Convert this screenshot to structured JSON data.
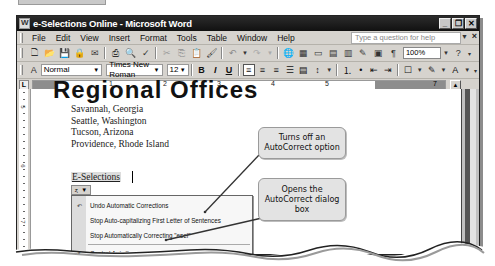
{
  "window": {
    "title": "e-Selections Online - Microsoft Word",
    "controls": [
      "minimize",
      "restore",
      "close"
    ]
  },
  "menubar": {
    "items": [
      "File",
      "Edit",
      "View",
      "Insert",
      "Format",
      "Tools",
      "Table",
      "Window",
      "Help"
    ],
    "help_placeholder": "Type a question for help",
    "close_doc": "×"
  },
  "standard_toolbar": {
    "zoom": "100%",
    "icons": [
      "new",
      "open",
      "save",
      "permission",
      "email",
      "print",
      "print-preview",
      "spelling",
      "cut",
      "copy",
      "paste",
      "format-painter",
      "undo",
      "redo",
      "hyperlink",
      "tables-borders",
      "insert-table",
      "insert-excel",
      "columns",
      "drawing",
      "document-map",
      "show-hide",
      "zoom",
      "help"
    ]
  },
  "format_toolbar": {
    "style": "Normal",
    "font": "Times New Roman",
    "size": "12",
    "bold": "B",
    "italic": "I",
    "underline": "U",
    "show_hide": "¶"
  },
  "ruler": {
    "numbers": [
      "1",
      "2",
      "3",
      "4",
      "5",
      "7"
    ],
    "vertical_numbers": [
      "5",
      "6",
      "7"
    ]
  },
  "document": {
    "heading": "Regional Offices",
    "lines": [
      "Savannah, Georgia",
      "Seattle, Washington",
      "Tucson, Arizona",
      "Providence, Rhode Island"
    ],
    "corrected_word": "E-Selections"
  },
  "autocorrect_menu": {
    "items": [
      {
        "label": "Undo Automatic Corrections",
        "icon": "undo-icon"
      },
      {
        "label": "Stop Auto-capitalizing First Letter of Sentences",
        "icon": ""
      },
      {
        "label": "Stop Automatically Correcting \"esel\"",
        "icon": ""
      },
      {
        "label": "Control AutoCorrect Options...",
        "icon": "autocorrect-icon"
      }
    ]
  },
  "callouts": [
    {
      "text": "Turns off an AutoCorrect option"
    },
    {
      "text": "Opens the AutoCorrect dialog box"
    }
  ]
}
